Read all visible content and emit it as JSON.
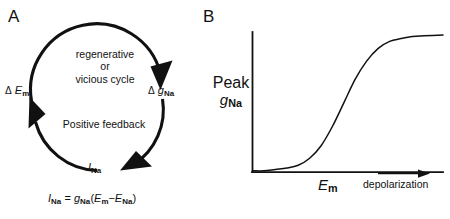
{
  "figure": {
    "background_color": "#ffffff",
    "ink_color": "#111111"
  },
  "panel_a": {
    "letter": "A",
    "cycle_center_lines": [
      "regenerative",
      "or",
      "vicious cycle"
    ],
    "cycle_center_text": "regenerative or vicious cycle",
    "feedback_text": "Positive feedback",
    "nodes": [
      {
        "name": "delta-em",
        "symbol_delta": "Δ",
        "symbol_main": "E",
        "subscript": "m",
        "text": "Δ E m"
      },
      {
        "name": "delta-gna",
        "symbol_delta": "Δ",
        "symbol_main": "g",
        "subscript": "Na",
        "text": "Δ g Na"
      },
      {
        "name": "ina",
        "symbol_delta": "",
        "symbol_main": "I",
        "subscript": "Na",
        "text": "I Na"
      }
    ],
    "arrow_direction": "clockwise",
    "equation": {
      "lhs_main": "I",
      "lhs_sub": "Na",
      "equals": "=",
      "rhs_g": "g",
      "rhs_g_sub": "Na",
      "open_paren": "(",
      "term1_main": "E",
      "term1_sub": "m",
      "minus": "−",
      "term2_main": "E",
      "term2_sub": "Na",
      "close_paren": ")",
      "text": "I_Na = g_Na (E_m − E_Na)"
    }
  },
  "panel_b": {
    "letter": "B",
    "y_axis_label_line1": "Peak",
    "y_axis_label_main": "g",
    "y_axis_label_sub": "Na",
    "y_axis_label_text": "Peak g_Na",
    "x_tick_main": "E",
    "x_tick_sub": "m",
    "x_tick_text": "E_m",
    "x_direction_label": "depolarization",
    "direction_arrow": "right"
  },
  "chart_data": {
    "type": "line",
    "title": "",
    "xlabel": "E_m (depolarization)",
    "ylabel": "Peak g_Na",
    "grid": false,
    "legend": null,
    "axis_style": "L-shaped spine, no tick marks, no numeric tick labels",
    "xlim": [
      0,
      1
    ],
    "ylim": [
      0,
      1
    ],
    "annotations": [
      {
        "name": "x-tick-em",
        "text": "E_m",
        "x": 0.38
      },
      {
        "name": "x-direction",
        "text": "depolarization",
        "arrow": "right",
        "x_from": 0.66,
        "x_to": 0.9
      }
    ],
    "series": [
      {
        "name": "Peak sodium conductance",
        "description": "sigmoid / Boltzmann activation curve",
        "x": [
          0.0,
          0.06,
          0.12,
          0.18,
          0.24,
          0.3,
          0.36,
          0.42,
          0.48,
          0.54,
          0.6,
          0.66,
          0.72,
          0.78,
          0.84,
          0.9,
          1.0
        ],
        "y": [
          0.01,
          0.01,
          0.02,
          0.03,
          0.05,
          0.1,
          0.19,
          0.33,
          0.5,
          0.67,
          0.8,
          0.89,
          0.94,
          0.96,
          0.975,
          0.98,
          0.985
        ]
      }
    ]
  }
}
